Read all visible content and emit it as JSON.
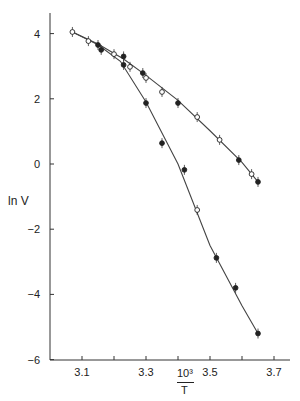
{
  "chart_data": {
    "type": "scatter",
    "title": "",
    "xlabel_num": "10³",
    "xlabel_den": "T",
    "ylabel": "ln V",
    "xlim": [
      3.0,
      3.75
    ],
    "ylim": [
      -6,
      4.6
    ],
    "xticks": [
      3.1,
      3.2,
      3.3,
      3.4,
      3.5,
      3.6,
      3.7
    ],
    "xtick_labels": [
      "3.1",
      "",
      "3.3",
      "",
      "3.5",
      "",
      "3.7"
    ],
    "yticks": [
      4,
      2,
      0,
      -2,
      -4,
      -6
    ],
    "ytick_labels": [
      "4",
      "2",
      "0",
      "−2",
      "−4",
      "−6"
    ],
    "grid": false,
    "series": [
      {
        "name": "upper curve (fit)",
        "style": "line",
        "x": [
          3.07,
          3.15,
          3.23,
          3.3,
          3.4,
          3.5,
          3.6,
          3.65
        ],
        "y": [
          4.05,
          3.68,
          3.22,
          2.72,
          1.95,
          1.02,
          0.05,
          -0.55
        ]
      },
      {
        "name": "lower curve (fit)",
        "style": "line",
        "x": [
          3.07,
          3.15,
          3.22,
          3.3,
          3.4,
          3.5,
          3.6,
          3.65
        ],
        "y": [
          4.05,
          3.66,
          3.15,
          1.9,
          0.0,
          -2.5,
          -4.35,
          -5.2
        ]
      },
      {
        "name": "open circles",
        "style": "open",
        "x": [
          3.07,
          3.12,
          3.2,
          3.25,
          3.3,
          3.35,
          3.46,
          3.46,
          3.53,
          3.63
        ],
        "y": [
          4.05,
          3.77,
          3.37,
          2.98,
          2.64,
          2.21,
          1.44,
          -1.41,
          0.74,
          -0.31
        ]
      },
      {
        "name": "filled circles",
        "style": "filled",
        "x": [
          3.15,
          3.16,
          3.23,
          3.23,
          3.29,
          3.3,
          3.35,
          3.4,
          3.42,
          3.52,
          3.59,
          3.58,
          3.65,
          3.65
        ],
        "y": [
          3.65,
          3.5,
          3.3,
          3.04,
          2.79,
          1.87,
          0.64,
          1.87,
          -0.18,
          -2.88,
          0.12,
          -3.8,
          -0.55,
          -5.2
        ]
      }
    ]
  }
}
